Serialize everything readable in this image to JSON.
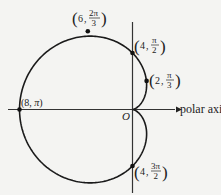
{
  "diagram": {
    "curve": {
      "type": "cardioid",
      "a": 4,
      "equation": "r = 4 - 4cosθ",
      "color": "#1a1a1a"
    },
    "axes": {
      "polar_axis_label": "polar axis",
      "origin_label": "O"
    },
    "points": [
      {
        "name": "point-8-pi",
        "r": 8,
        "theta_label": "π",
        "label_r": "8",
        "label_theta": "π"
      },
      {
        "name": "point-6-2pi3",
        "r": 6,
        "label_r": "6",
        "theta_num": "2π",
        "theta_den": "3"
      },
      {
        "name": "point-4-pi2",
        "r": 4,
        "label_r": "4",
        "theta_num": "π",
        "theta_den": "2"
      },
      {
        "name": "point-2-pi3",
        "r": 2,
        "label_r": "2",
        "theta_num": "π",
        "theta_den": "3"
      },
      {
        "name": "point-4-3pi2",
        "r": 4,
        "label_r": "4",
        "theta_num": "3π",
        "theta_den": "2"
      }
    ]
  }
}
